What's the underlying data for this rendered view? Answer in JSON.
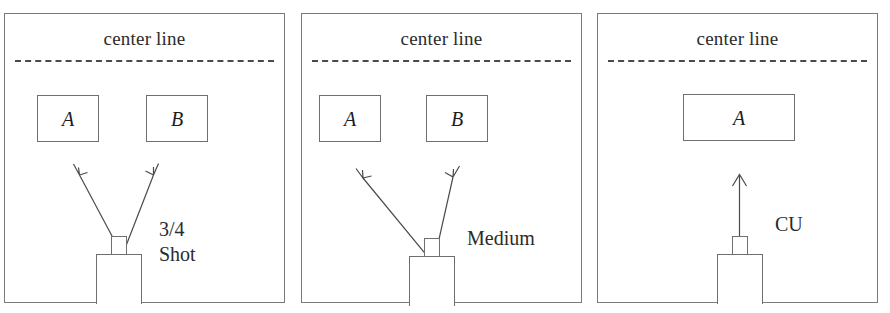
{
  "figure": {
    "panel_count": 3,
    "line_color": "#4a4a4a",
    "border_color": "#7b7b7b",
    "text_color": "#2b2b2b",
    "background": "#ffffff"
  },
  "panels": [
    {
      "id": "panel-1",
      "center_line_label": "center line",
      "shot_label": "3/4\nShot",
      "shot_label_lines": [
        "3/4",
        "Shot"
      ],
      "subjects": [
        {
          "label": "A"
        },
        {
          "label": "B"
        }
      ],
      "camera": {
        "name": "camera",
        "arrow_count": 2
      }
    },
    {
      "id": "panel-2",
      "center_line_label": "center line",
      "shot_label": "Medium",
      "shot_label_lines": [
        "Medium"
      ],
      "subjects": [
        {
          "label": "A"
        },
        {
          "label": "B"
        }
      ],
      "camera": {
        "name": "camera",
        "arrow_count": 2
      }
    },
    {
      "id": "panel-3",
      "center_line_label": "center line",
      "shot_label": "CU",
      "shot_label_lines": [
        "CU"
      ],
      "subjects": [
        {
          "label": "A"
        }
      ],
      "camera": {
        "name": "camera",
        "arrow_count": 1
      }
    }
  ]
}
